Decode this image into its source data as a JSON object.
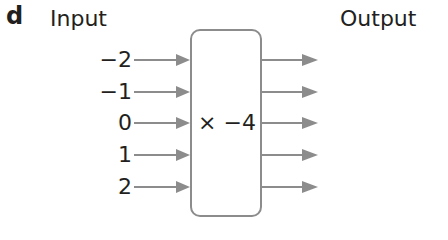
{
  "part_label": "d",
  "headers": {
    "input": "Input",
    "output": "Output"
  },
  "function_box": {
    "operation": "× −4"
  },
  "inputs": [
    "−2",
    "−1",
    "0",
    "1",
    "2"
  ],
  "colors": {
    "arrow": "#8c8c8c",
    "text": "#231f20",
    "box_border": "#8c8c8c"
  }
}
